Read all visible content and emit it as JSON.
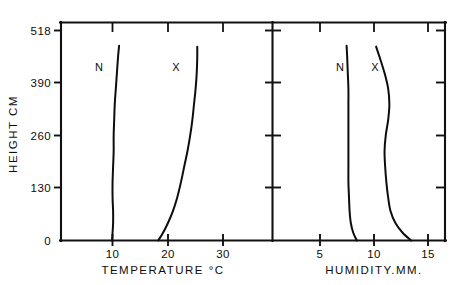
{
  "figure": {
    "background_color": "#ffffff",
    "ink_color": "#0d0d0d",
    "width": 460,
    "height": 285
  },
  "chart_data": [
    {
      "type": "line",
      "panel": "left",
      "title": "",
      "xlabel": "TEMPERATURE °C",
      "ylabel": "HEIGHT CM",
      "xlim": [
        0.5,
        32.0
      ],
      "ylim": [
        0,
        560
      ],
      "xticks": [
        10,
        20,
        30
      ],
      "xtick_labels": [
        "10",
        "20",
        "30"
      ],
      "yticks": [
        0,
        130,
        260,
        390,
        518
      ],
      "ytick_labels": [
        "0",
        "130",
        "260",
        "390",
        "518"
      ],
      "grid": false,
      "legend": "inline-curve-labels",
      "series": [
        {
          "name": "N",
          "label": "N",
          "label_x": 7.6,
          "label_y": 425,
          "x": [
            9.9,
            10.0,
            10.1,
            10.1,
            10.0,
            10.0,
            10.1,
            10.2,
            10.2,
            10.3,
            10.4,
            10.6,
            10.8,
            11.0,
            11.2
          ],
          "y": [
            0,
            20,
            45,
            75,
            110,
            150,
            190,
            230,
            270,
            310,
            350,
            390,
            430,
            470,
            500
          ]
        },
        {
          "name": "X",
          "label": "X",
          "label_x": 21.4,
          "label_y": 425,
          "x": [
            18.4,
            19.3,
            20.2,
            21.1,
            21.9,
            22.6,
            23.2,
            23.8,
            24.3,
            24.7,
            25.0,
            25.3,
            25.5,
            25.6,
            25.6
          ],
          "y": [
            0,
            20,
            45,
            75,
            110,
            150,
            190,
            230,
            270,
            310,
            350,
            390,
            430,
            470,
            498
          ]
        }
      ]
    },
    {
      "type": "line",
      "panel": "right",
      "title": "",
      "xlabel": "HUMIDITY.MM.",
      "ylabel": "HEIGHT CM",
      "xlim": [
        2.3,
        16.7
      ],
      "ylim": [
        0,
        560
      ],
      "xticks": [
        5,
        10,
        15
      ],
      "xtick_labels": [
        "5",
        "10",
        "15"
      ],
      "yticks": [
        0,
        130,
        260,
        390,
        518
      ],
      "ytick_labels": [
        "",
        "",
        "",
        "",
        ""
      ],
      "grid": false,
      "legend": "inline-curve-labels",
      "series": [
        {
          "name": "N",
          "label": "N",
          "label_x": 7.5,
          "label_y": 425,
          "x": [
            9.3,
            9.0,
            8.8,
            8.7,
            8.65,
            8.6,
            8.6,
            8.6,
            8.6,
            8.6,
            8.6,
            8.6,
            8.55,
            8.5,
            8.45
          ],
          "y": [
            0,
            20,
            45,
            75,
            110,
            150,
            190,
            230,
            270,
            310,
            350,
            390,
            430,
            470,
            500
          ]
        },
        {
          "name": "X",
          "label": "X",
          "label_x": 10.4,
          "label_y": 425,
          "x": [
            13.8,
            13.1,
            12.5,
            12.1,
            11.9,
            11.75,
            11.65,
            11.6,
            11.7,
            11.9,
            12.0,
            11.9,
            11.6,
            11.2,
            10.9
          ],
          "y": [
            0,
            20,
            45,
            75,
            110,
            150,
            190,
            230,
            270,
            310,
            350,
            390,
            430,
            470,
            498
          ]
        }
      ]
    }
  ]
}
